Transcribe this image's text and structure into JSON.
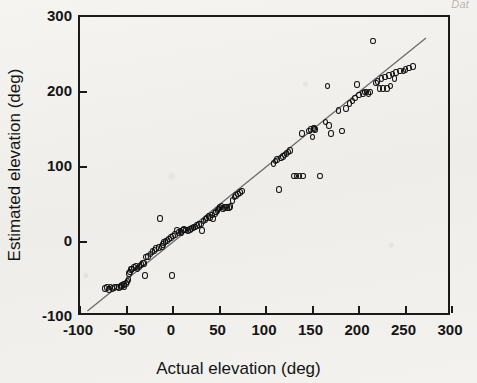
{
  "header": {
    "running_head": "Dat"
  },
  "chart_data": {
    "type": "scatter",
    "title": "",
    "xlabel": "Actual elevation  (deg)",
    "ylabel": "Estimated elevation  (deg)",
    "xlim": [
      -100,
      300
    ],
    "ylim": [
      -100,
      300
    ],
    "xticks": [
      -100,
      -50,
      0,
      50,
      100,
      150,
      200,
      250,
      300
    ],
    "yticks": [
      -100,
      0,
      100,
      200,
      300
    ],
    "xticklabels": [
      "-100",
      "-50",
      "0",
      "50",
      "100",
      "150",
      "200",
      "250",
      "300"
    ],
    "yticklabels": [
      "-100",
      "0",
      "100",
      "200",
      "300"
    ],
    "grid": false,
    "legend": null,
    "marker": "open-circle",
    "marker_color": "#121212",
    "line_color": "#6b6b6b",
    "fit_line": {
      "kind": "identity",
      "x0": -92,
      "y0": -92,
      "x1": 272,
      "y1": 272
    },
    "points": [
      [
        -73,
        -62
      ],
      [
        -71,
        -61
      ],
      [
        -69,
        -63
      ],
      [
        -67,
        -60
      ],
      [
        -65,
        -62
      ],
      [
        -63,
        -61
      ],
      [
        -60,
        -60
      ],
      [
        -58,
        -61
      ],
      [
        -56,
        -59
      ],
      [
        -55,
        -58
      ],
      [
        -53,
        -57
      ],
      [
        -52,
        -59
      ],
      [
        -50,
        -55
      ],
      [
        -49,
        -53
      ],
      [
        -48,
        -50
      ],
      [
        -47,
        -42
      ],
      [
        -46,
        -40
      ],
      [
        -45,
        -37
      ],
      [
        -44,
        -36
      ],
      [
        -42,
        -34
      ],
      [
        -40,
        -33
      ],
      [
        -38,
        -35
      ],
      [
        -36,
        -33
      ],
      [
        -34,
        -30
      ],
      [
        -32,
        -28
      ],
      [
        -31,
        -29
      ],
      [
        -30,
        -45
      ],
      [
        -29,
        -20
      ],
      [
        -27,
        -19
      ],
      [
        -24,
        -16
      ],
      [
        -22,
        -13
      ],
      [
        -20,
        -11
      ],
      [
        -18,
        -9
      ],
      [
        -15,
        -7
      ],
      [
        -14,
        31
      ],
      [
        -12,
        -6
      ],
      [
        -11,
        -3
      ],
      [
        -10,
        -1
      ],
      [
        -8,
        1
      ],
      [
        -6,
        2
      ],
      [
        -4,
        4
      ],
      [
        -2,
        6
      ],
      [
        -1,
        -45
      ],
      [
        0,
        8
      ],
      [
        2,
        10
      ],
      [
        4,
        15
      ],
      [
        6,
        13
      ],
      [
        8,
        14
      ],
      [
        9,
        12
      ],
      [
        11,
        16
      ],
      [
        12,
        17
      ],
      [
        14,
        16
      ],
      [
        16,
        15
      ],
      [
        18,
        17
      ],
      [
        20,
        18
      ],
      [
        22,
        19
      ],
      [
        24,
        20
      ],
      [
        26,
        22
      ],
      [
        28,
        23
      ],
      [
        30,
        24
      ],
      [
        31,
        15
      ],
      [
        33,
        28
      ],
      [
        35,
        30
      ],
      [
        36,
        32
      ],
      [
        38,
        34
      ],
      [
        40,
        33
      ],
      [
        42,
        36
      ],
      [
        43,
        31
      ],
      [
        45,
        38
      ],
      [
        46,
        40
      ],
      [
        48,
        42
      ],
      [
        49,
        44
      ],
      [
        50,
        46
      ],
      [
        52,
        47
      ],
      [
        54,
        45
      ],
      [
        56,
        46
      ],
      [
        58,
        46
      ],
      [
        60,
        46
      ],
      [
        62,
        47
      ],
      [
        64,
        55
      ],
      [
        66,
        60
      ],
      [
        68,
        62
      ],
      [
        70,
        64
      ],
      [
        72,
        66
      ],
      [
        74,
        68
      ],
      [
        108,
        105
      ],
      [
        110,
        108
      ],
      [
        112,
        110
      ],
      [
        114,
        70
      ],
      [
        116,
        112
      ],
      [
        118,
        114
      ],
      [
        120,
        116
      ],
      [
        122,
        118
      ],
      [
        124,
        120
      ],
      [
        126,
        122
      ],
      [
        130,
        88
      ],
      [
        133,
        88
      ],
      [
        136,
        88
      ],
      [
        139,
        145
      ],
      [
        140,
        88
      ],
      [
        146,
        148
      ],
      [
        148,
        150
      ],
      [
        150,
        140
      ],
      [
        151,
        152
      ],
      [
        152,
        151
      ],
      [
        153,
        150
      ],
      [
        158,
        88
      ],
      [
        164,
        160
      ],
      [
        166,
        208
      ],
      [
        168,
        155
      ],
      [
        170,
        145
      ],
      [
        178,
        175
      ],
      [
        182,
        148
      ],
      [
        186,
        178
      ],
      [
        190,
        185
      ],
      [
        193,
        188
      ],
      [
        196,
        192
      ],
      [
        198,
        210
      ],
      [
        200,
        196
      ],
      [
        204,
        198
      ],
      [
        206,
        200
      ],
      [
        208,
        200
      ],
      [
        210,
        198
      ],
      [
        212,
        200
      ],
      [
        215,
        268
      ],
      [
        218,
        212
      ],
      [
        220,
        214
      ],
      [
        222,
        205
      ],
      [
        224,
        218
      ],
      [
        226,
        205
      ],
      [
        228,
        220
      ],
      [
        230,
        205
      ],
      [
        232,
        222
      ],
      [
        234,
        208
      ],
      [
        236,
        224
      ],
      [
        238,
        218
      ],
      [
        240,
        226
      ],
      [
        244,
        228
      ],
      [
        248,
        228
      ],
      [
        250,
        230
      ],
      [
        254,
        232
      ],
      [
        258,
        234
      ]
    ]
  }
}
